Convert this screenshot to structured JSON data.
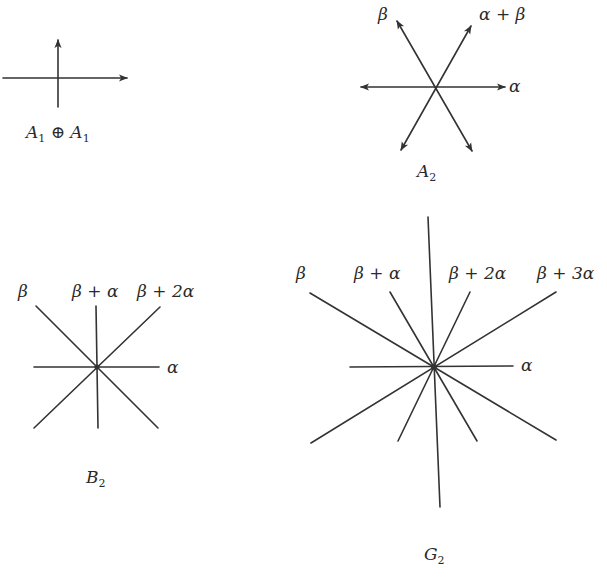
{
  "diagrams": {
    "a1a1": {
      "name": "A1 ⊕ A1",
      "label_main": "A",
      "label_sub1": "1",
      "label_op": " ⊕ ",
      "label_main2": "A",
      "label_sub2": "1",
      "center": [
        58,
        78
      ],
      "roots": [
        "horizontal",
        "vertical"
      ]
    },
    "a2": {
      "name": "A2",
      "label_main": "A",
      "label_sub": "2",
      "center": [
        436,
        87
      ],
      "root_labels": {
        "beta": "β",
        "alpha_plus_beta": "α + β",
        "alpha": "α"
      }
    },
    "b2": {
      "name": "B2",
      "label_main": "B",
      "label_sub": "2",
      "center": [
        97,
        367
      ],
      "root_labels": {
        "beta": "β",
        "beta_plus_alpha": "β + α",
        "beta_plus_2alpha": "β + 2α",
        "alpha": "α"
      }
    },
    "g2": {
      "name": "G2",
      "label_main": "G",
      "label_sub": "2",
      "center": [
        434,
        367
      ],
      "root_labels": {
        "beta": "β",
        "beta_plus_alpha": "β + α",
        "beta_plus_2alpha": "β + 2α",
        "beta_plus_3alpha": "β + 3α",
        "alpha": "α"
      }
    }
  },
  "colors": {
    "stroke": "#333333",
    "text": "#2a2a2a",
    "background": "#ffffff"
  }
}
